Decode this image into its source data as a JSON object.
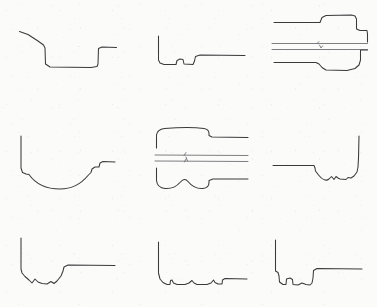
{
  "figure": {
    "background_color": "#fbfbfa",
    "line_color": "#3a3a3c",
    "axis_color": "#54545a",
    "width": 377,
    "height": 307,
    "grid": {
      "rows": 3,
      "columns": 3
    }
  },
  "panels": [
    {
      "id": "panel-1",
      "position": "top-left",
      "row": 1,
      "column": 1,
      "type": "single-profile",
      "description": "Left end slopes gently down, drops steeply to a flat recessed floor, then steps up at right to a flat land",
      "x": 18,
      "y": 26,
      "w": 100,
      "h": 44,
      "paths": [
        {
          "name": "outline",
          "kind": "profile",
          "d": "M 1.5 5.5 L 10 8.5 L 20 15 L 25.5 19 L 27 22 L 27.5 38 L 32 41 L 73 41.5 L 79 40.5 L 80 38 L 80.5 22.5 L 84 21 L 98.5 21.5"
        }
      ]
    },
    {
      "id": "panel-2",
      "position": "top-middle",
      "row": 1,
      "column": 2,
      "type": "single-profile",
      "description": "Vertical left wall dropping to a flat floor with a small raised bump, a short step up, then a long flat land to the right",
      "x": 155,
      "y": 34,
      "w": 95,
      "h": 38,
      "paths": [
        {
          "name": "outline",
          "kind": "profile",
          "d": "M 3.5 2 L 3.5 26 L 5 29 L 9 30.5 L 21 30.5 L 22 26.5 L 25 25 L 28 25.5 L 29 30 L 38 30.5 L 39.5 27 L 40.5 22.5 L 45 21 L 90 21.5"
        }
      ]
    },
    {
      "id": "panel-3",
      "position": "top-right",
      "row": 1,
      "column": 3,
      "type": "mirrored-pair-with-axis",
      "description": "Symmetric turned part: upper half with a raised stepped shoulder and a notch at the right end, centre axis lines, lower mirrored half with a rounded fillet bulge",
      "x": 272,
      "y": 12,
      "w": 100,
      "h": 62,
      "paths": [
        {
          "name": "upper-outline",
          "kind": "profile",
          "d": "M 2 10.5 L 48 10.5 L 49 8 L 50 5.5 L 54 3.5 L 79.5 3 L 83 4 L 84.5 7 L 84.5 17 L 88 18.5 L 95 18.5 L 95.5 22 L 95.5 30"
        },
        {
          "name": "lower-outline",
          "kind": "profile",
          "d": "M 2 50.5 L 38 50.5 L 44 50.5 L 47 52 L 50 55.5 L 54 58 L 75 58.5 L 83 56.5 L 87 53 L 88.5 48 L 88.5 38 L 95.5 38"
        },
        {
          "name": "centre-axis-upper",
          "kind": "axis",
          "d": "M 0 31.5 L 95.5 31.5"
        },
        {
          "name": "centre-axis-lower",
          "kind": "axis",
          "d": "M 0 37.5 L 95.5 37.5"
        },
        {
          "name": "axis-tick",
          "kind": "tick",
          "d": "M 45 31.5 L 47 29.5 M 47.5 33 L 49 36 L 50.5 34"
        }
      ]
    },
    {
      "id": "panel-4",
      "position": "middle-left",
      "row": 2,
      "column": 1,
      "type": "single-profile",
      "description": "Tall vertical left wall dropping to a broad smooth concave arc floor, rising to a step and a flat land at the right",
      "x": 18,
      "y": 134,
      "w": 100,
      "h": 55,
      "paths": [
        {
          "name": "outline",
          "kind": "profile",
          "d": "M 3 2 L 3 34 L 4.5 38.5 L 8 40 L 11 40.5 C 18 50.5 30 55 42 55 C 54 55 63 50 70 41.5 L 73 38.5 L 74 35 L 77 33 L 81 33 L 82 29 L 85 27.5 L 97 28"
        }
      ]
    },
    {
      "id": "panel-5",
      "position": "middle-center",
      "row": 2,
      "column": 2,
      "type": "mirrored-pair-with-axis",
      "description": "Symmetric turned part: upper half with a rounded crowned head stepping down to a shank, centre axis lines, lower mirrored half with two rounded lobes",
      "x": 155,
      "y": 126,
      "w": 100,
      "h": 68,
      "paths": [
        {
          "name": "upper-outline",
          "kind": "profile",
          "d": "M 1.5 22 L 1.5 9 C 2 5 5 3 9.5 2.5 C 22 1.5 38 1 49 2.5 C 52.5 3 54 5 54 7.5 L 54 9.5 L 57 11 L 93 11.5"
        },
        {
          "name": "lower-outline",
          "kind": "profile",
          "d": "M 1.5 42 L 1.5 54.5 C 2 59 5 62 10 62.5 C 16 63 21 61 25 56.5 C 28 53 30.5 52.5 33 55.5 C 37 60.5 42 63 48 62.5 C 52 62 54 59.5 54 56.5 L 54 54.5 L 58 53 L 93 53"
        },
        {
          "name": "centre-axis-upper",
          "kind": "axis",
          "d": "M 0 29 L 93 29.5"
        },
        {
          "name": "centre-axis-lower",
          "kind": "axis",
          "d": "M 0 35 L 93 35.5"
        },
        {
          "name": "axis-tick",
          "kind": "tick",
          "d": "M 29 29.5 L 31 26.5 M 31 31 L 32.5 35 M 29.5 36 L 31 33"
        }
      ]
    },
    {
      "id": "panel-6",
      "position": "middle-right",
      "row": 2,
      "column": 3,
      "type": "single-profile",
      "description": "Mirrored orientation: flat land from the left, a step down into a wavy scalloped valley, then a tall vertical wall rising at the right",
      "x": 272,
      "y": 134,
      "w": 100,
      "h": 55,
      "paths": [
        {
          "name": "outline",
          "kind": "profile",
          "d": "M 1 31.5 L 42 31.5 L 43 34 L 43.5 37 L 46.5 41 C 50 45.5 54 47.5 57 45 L 59.5 42.5 L 62 45.5 L 64 42.5 L 66 44 L 68 45 L 74 45.5 L 76 43.5 L 79 44 L 82 42 L 85 38 L 86 33 L 86.5 24 L 87 2"
        }
      ]
    },
    {
      "id": "panel-7",
      "position": "bottom-left",
      "row": 3,
      "column": 1,
      "type": "single-profile",
      "description": "Tall vertical left wall dropping to a jagged scalloped valley floor, then a step up to a long flat land",
      "x": 18,
      "y": 235,
      "w": 100,
      "h": 55,
      "paths": [
        {
          "name": "outline",
          "kind": "profile",
          "d": "M 3 3 L 3 34 L 4 38 L 7 41.5 L 11 45 L 14 48 L 17 44 L 20 47 L 24 48.5 L 29 49 L 33 46.5 L 36 48.5 L 39 46 L 43 41 L 45 36 L 46 32 L 50 30 L 97 30.5"
        }
      ]
    },
    {
      "id": "panel-8",
      "position": "bottom-center",
      "row": 3,
      "column": 2,
      "type": "single-profile",
      "description": "Tall vertical left wall dropping to a shallow flat floor with several small spikes and steps, a step up at the right and a flat land",
      "x": 155,
      "y": 240,
      "w": 100,
      "h": 50,
      "paths": [
        {
          "name": "outline",
          "kind": "profile",
          "d": "M 3.5 2 L 3.5 33 L 5 39 L 8 42.5 L 12 44.5 L 15 44.5 L 15.5 40.5 L 17 40 L 18.5 43 L 22 44.5 L 30 44.5 L 34 43 L 37 40.5 L 39 43 L 42 44.5 L 52 44.5 L 56 43 L 58.5 40 L 60 42.5 L 63 44 L 67 44 L 67.5 40 L 70 38.5 L 92 39"
        }
      ]
    },
    {
      "id": "panel-9",
      "position": "bottom-right",
      "row": 3,
      "column": 3,
      "type": "single-profile",
      "description": "Tall vertical left wall with a small step, a notched jagged valley floor, then a step up to a long flat land",
      "x": 272,
      "y": 238,
      "w": 100,
      "h": 52,
      "paths": [
        {
          "name": "outline",
          "kind": "profile",
          "d": "M 3.5 2 L 3.5 33 L 6 34.5 L 7 38 L 7.5 44 L 11 46.5 L 14 46.5 L 14.5 41 L 18 40 L 20.5 41.5 L 21 46.5 L 26 47 L 30 45 L 34 46.5 L 38 47 L 40 45 L 41 40 L 41.5 32.5 L 45 30.5 L 90 31"
        }
      ]
    }
  ]
}
